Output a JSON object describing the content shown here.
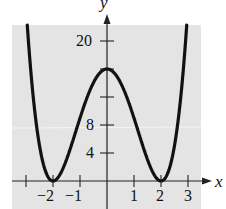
{
  "chart_data": {
    "type": "line",
    "title": "",
    "function": "y = (x^2 - 4)^2",
    "xlabel": "x",
    "ylabel": "y",
    "xlim": [
      -3.5,
      3.4
    ],
    "ylim": [
      -3.4,
      22.5
    ],
    "grid": false,
    "background": "#e6e6e6",
    "curve_color": "#111111",
    "x_ticks": [
      -3,
      -2,
      -1,
      0,
      1,
      2,
      3
    ],
    "x_tick_labels": [
      "-2",
      "-1",
      "1",
      "2",
      "3"
    ],
    "y_ticks": [
      4,
      8,
      12,
      16,
      20
    ],
    "y_tick_labels": [
      "4",
      "8",
      "20"
    ],
    "key_points": [
      {
        "x": -2,
        "y": 0,
        "label": "zero"
      },
      {
        "x": 0,
        "y": 16,
        "label": "local max"
      },
      {
        "x": 2,
        "y": 0,
        "label": "zero"
      }
    ],
    "series": [
      {
        "name": "y=(x^2-4)^2",
        "x": [
          -3.0,
          -2.75,
          -2.5,
          -2.25,
          -2.0,
          -1.75,
          -1.5,
          -1.25,
          -1.0,
          -0.75,
          -0.5,
          -0.25,
          0,
          0.25,
          0.5,
          0.75,
          1.0,
          1.25,
          1.5,
          1.75,
          2.0,
          2.25,
          2.5,
          2.75,
          3.0
        ],
        "values": [
          25,
          12.4,
          5.06,
          1.13,
          0,
          0.88,
          3.06,
          5.88,
          9,
          11.82,
          14.06,
          15.5,
          16,
          15.5,
          14.06,
          11.82,
          9,
          5.88,
          3.06,
          0.88,
          0,
          1.13,
          5.06,
          12.4,
          25
        ]
      }
    ]
  },
  "labels": {
    "x_axis": "x",
    "y_axis": "y",
    "xt_m2": "−2",
    "xt_m1": "−1",
    "xt_1": "1",
    "xt_2": "2",
    "xt_3": "3",
    "yt_20": "20",
    "yt_8": "8",
    "yt_4": "4"
  }
}
